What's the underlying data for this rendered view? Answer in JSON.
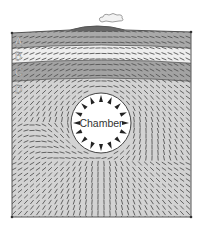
{
  "diagram": {
    "layers": [
      {
        "label": "A",
        "color": "#a9a9a9",
        "top": 32,
        "bottom": 50
      },
      {
        "label": "B",
        "color": "#eeeeee",
        "top": 50,
        "bottom": 64
      },
      {
        "label": "C",
        "color": "#a3a3a3",
        "top": 64,
        "bottom": 80
      },
      {
        "label": "D",
        "color": "#d3d3d3",
        "top": 80,
        "bottom": 217
      }
    ],
    "chamber": {
      "label": "Chamber",
      "cx": 101,
      "cy": 123,
      "r": 30,
      "fill": "#ffffff"
    },
    "volcano": {
      "color": "#666666"
    },
    "outline_color": "#555555",
    "stress_mark_color": "#555555"
  }
}
